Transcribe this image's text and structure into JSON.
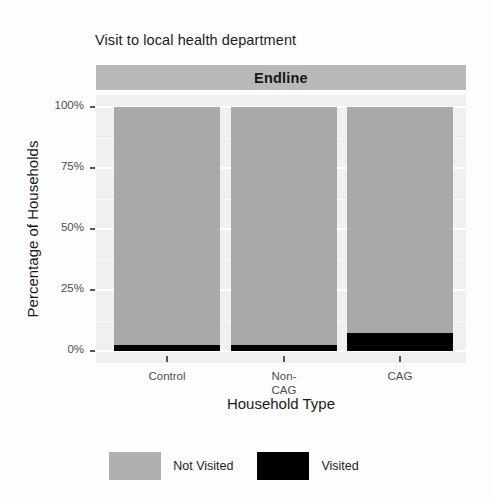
{
  "chart_data": {
    "type": "bar",
    "title": "Visit to local health department",
    "facet_label": "Endline",
    "xlabel": "Household Type",
    "ylabel": "Percentage of Households",
    "categories": [
      "Control",
      "Non-\nCAG",
      "CAG"
    ],
    "category_labels": [
      {
        "line1": "Control",
        "line2": ""
      },
      {
        "line1": "Non-",
        "line2": "CAG"
      },
      {
        "line1": "CAG",
        "line2": ""
      }
    ],
    "stacked": true,
    "ylim": [
      0,
      100
    ],
    "ytick_labels": [
      "0%",
      "25%",
      "50%",
      "75%",
      "100%"
    ],
    "ytick_values": [
      0,
      25,
      50,
      75,
      100
    ],
    "grid": true,
    "legend_position": "bottom",
    "series": [
      {
        "name": "Not Visited",
        "color": "#a9a9a9",
        "values": [
          97.5,
          97.5,
          92.5
        ]
      },
      {
        "name": "Visited",
        "color": "#000000",
        "values": [
          2.5,
          2.5,
          7.5
        ]
      }
    ]
  },
  "legend": {
    "items": [
      {
        "label": "Not Visited",
        "color": "#b0b0b0"
      },
      {
        "label": "Visited",
        "color": "#000000"
      }
    ]
  },
  "colors": {
    "panel_background": "#f0f0f0",
    "strip_background": "#b9b9b9",
    "gridline": "#ffffff",
    "not_visited": "#a9a9a9",
    "visited": "#000000",
    "text": "#1c1c1c",
    "axis_text": "#4d4d4d"
  }
}
